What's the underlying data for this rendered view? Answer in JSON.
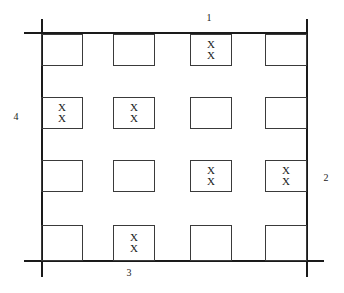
{
  "figure": {
    "title": "",
    "mark_symbol": "X",
    "line_color": "#1a1a1a",
    "cell_border_color": "#3a3a3a",
    "background_color": "#ffffff",
    "rows": 4,
    "columns": 4
  },
  "labels": {
    "top": "1",
    "right": "2",
    "bottom": "3",
    "left": "4"
  },
  "cells": [
    {
      "id": "r1c1",
      "row": 1,
      "col": 1,
      "marks": "",
      "marked": false
    },
    {
      "id": "r1c2",
      "row": 1,
      "col": 2,
      "marks": "",
      "marked": false
    },
    {
      "id": "r1c3",
      "row": 1,
      "col": 3,
      "marks": "X\nX",
      "marked": true
    },
    {
      "id": "r1c4",
      "row": 1,
      "col": 4,
      "marks": "",
      "marked": false
    },
    {
      "id": "r2c1",
      "row": 2,
      "col": 1,
      "marks": "X\nX",
      "marked": true
    },
    {
      "id": "r2c2",
      "row": 2,
      "col": 2,
      "marks": "X\nX",
      "marked": true
    },
    {
      "id": "r2c3",
      "row": 2,
      "col": 3,
      "marks": "",
      "marked": false
    },
    {
      "id": "r2c4",
      "row": 2,
      "col": 4,
      "marks": "",
      "marked": false
    },
    {
      "id": "r3c1",
      "row": 3,
      "col": 1,
      "marks": "",
      "marked": false
    },
    {
      "id": "r3c2",
      "row": 3,
      "col": 2,
      "marks": "",
      "marked": false
    },
    {
      "id": "r3c3",
      "row": 3,
      "col": 3,
      "marks": "X\nX",
      "marked": true
    },
    {
      "id": "r3c4",
      "row": 3,
      "col": 4,
      "marks": "X\nX",
      "marked": true
    },
    {
      "id": "r4c1",
      "row": 4,
      "col": 1,
      "marks": "",
      "marked": false
    },
    {
      "id": "r4c2",
      "row": 4,
      "col": 2,
      "marks": "X\nX",
      "marked": true
    },
    {
      "id": "r4c3",
      "row": 4,
      "col": 3,
      "marks": "",
      "marked": false
    },
    {
      "id": "r4c4",
      "row": 4,
      "col": 4,
      "marks": "",
      "marked": false
    }
  ],
  "mark_top": "X",
  "mark_bottom": "X"
}
